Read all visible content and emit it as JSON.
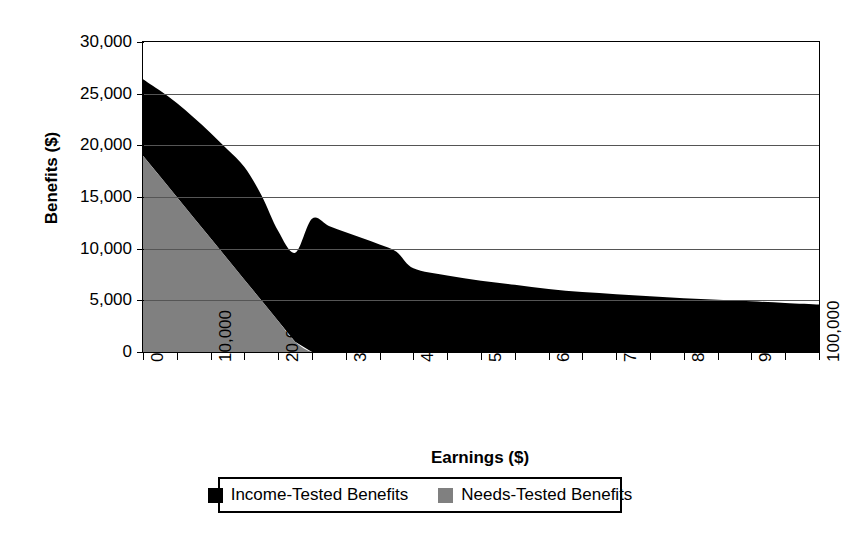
{
  "chart_data": {
    "type": "area",
    "stacked": true,
    "title": "",
    "xlabel": "Earnings ($)",
    "ylabel": "Benefits ($)",
    "xlim": [
      0,
      100000
    ],
    "ylim": [
      0,
      30000
    ],
    "grid": true,
    "legend_position": "bottom",
    "y_tick_labels": [
      "30,000",
      "25,000",
      "20,000",
      "15,000",
      "10,000",
      "5,000",
      "0"
    ],
    "y_tick_values": [
      30000,
      25000,
      20000,
      15000,
      10000,
      5000,
      0
    ],
    "x_tick_labels": [
      "0",
      "10,000",
      "20,000",
      "30,000",
      "40,000",
      "50,000",
      "60,000",
      "70,000",
      "80,000",
      "90,000",
      "100,000"
    ],
    "x_tick_values": [
      0,
      10000,
      20000,
      30000,
      40000,
      50000,
      60000,
      70000,
      80000,
      90000,
      100000
    ],
    "x_minor_tick_values": [
      5000,
      15000,
      25000,
      35000,
      45000,
      55000,
      65000,
      75000,
      85000,
      95000
    ],
    "x": [
      0,
      2500,
      5000,
      7500,
      10000,
      12500,
      15000,
      17500,
      20000,
      22500,
      25000,
      27500,
      30000,
      32500,
      35000,
      37500,
      40000,
      45000,
      50000,
      55000,
      60000,
      65000,
      70000,
      75000,
      80000,
      85000,
      90000,
      95000,
      100000
    ],
    "series": [
      {
        "name": "Needs-Tested Benefits",
        "color": "#808080",
        "values": [
          19000,
          17000,
          15000,
          13000,
          11000,
          9000,
          7000,
          5000,
          3000,
          1000,
          0,
          0,
          0,
          0,
          0,
          0,
          0,
          0,
          0,
          0,
          0,
          0,
          0,
          0,
          0,
          0,
          0,
          0,
          0
        ]
      },
      {
        "name": "Income-Tested Benefits",
        "color": "#000000",
        "values": [
          7400,
          8300,
          9100,
          9700,
          10200,
          10600,
          10900,
          10200,
          8700,
          8600,
          12900,
          12200,
          11600,
          11000,
          10400,
          9700,
          8100,
          7400,
          6900,
          6500,
          6100,
          5800,
          5600,
          5400,
          5200,
          5050,
          4900,
          4750,
          4600
        ]
      }
    ],
    "total_top_curve": {
      "description": "Top edge of stacked area (Income-Tested + Needs-Tested combined)",
      "values": [
        26400,
        25300,
        24100,
        22700,
        21200,
        19600,
        17900,
        15200,
        11700,
        9600,
        12900,
        12200,
        11600,
        11000,
        10400,
        9700,
        8100,
        7400,
        6900,
        6500,
        6100,
        5800,
        5600,
        5400,
        5200,
        5050,
        4900,
        4750,
        4600
      ]
    }
  },
  "axes": {
    "y_title": "Benefits ($)",
    "x_title": "Earnings ($)"
  },
  "legend": {
    "entries": [
      {
        "label": "Income-Tested Benefits",
        "color": "#000000",
        "swatch_name": "legend-swatch-income-tested"
      },
      {
        "label": "Needs-Tested Benefits",
        "color": "#808080",
        "swatch_name": "legend-swatch-needs-tested"
      }
    ]
  }
}
